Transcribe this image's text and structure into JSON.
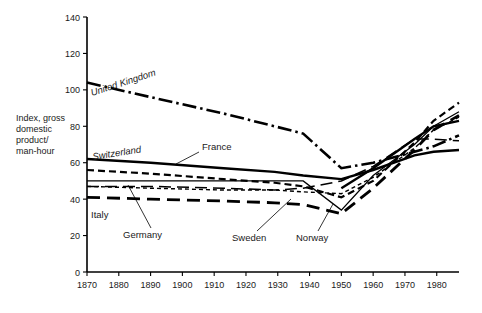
{
  "chart_data": {
    "type": "line",
    "title": "",
    "xlabel": "",
    "ylabel": "Index, gross domestic product/man-hour",
    "ylabel_lines": [
      "Index, gross",
      "domestic",
      "product/",
      "man-hour"
    ],
    "xlim": [
      1870,
      1987
    ],
    "ylim": [
      0,
      140
    ],
    "grid": false,
    "legend_position": "inline-labels",
    "y_ticks": [
      0,
      20,
      40,
      60,
      80,
      100,
      120,
      140
    ],
    "y_tick_labels": [
      "0",
      "20",
      "40",
      "60",
      "80",
      "100",
      "120",
      "140"
    ],
    "x_ticks": [
      1870,
      1880,
      1890,
      1900,
      1910,
      1920,
      1930,
      1940,
      1950,
      1960,
      1970,
      1980
    ],
    "x_tick_labels": [
      "1870",
      "1880",
      "1890",
      "1900",
      "1910",
      "1920",
      "1930",
      "1940",
      "1950",
      "1960",
      "1970",
      "1980"
    ],
    "series": [
      {
        "name": "United Kingdom",
        "label": "United Kingdom",
        "style": "dash-dot",
        "width": 2.6,
        "color": "#000000",
        "x": [
          1870,
          1890,
          1913,
          1929,
          1938,
          1950,
          1960,
          1973,
          1979,
          1987
        ],
        "values": [
          104,
          96,
          87,
          80,
          76,
          57,
          60,
          66,
          69,
          75
        ]
      },
      {
        "name": "Switzerland",
        "label": "Switzerland",
        "style": "solid",
        "width": 2.4,
        "color": "#000000",
        "x": [
          1870,
          1890,
          1913,
          1929,
          1938,
          1950,
          1960,
          1973,
          1979,
          1987
        ],
        "values": [
          62,
          60,
          57,
          55,
          53,
          51,
          56,
          64,
          66,
          67
        ]
      },
      {
        "name": "France",
        "label": "France",
        "style": "dashed",
        "width": 2.2,
        "color": "#000000",
        "x": [
          1870,
          1890,
          1913,
          1929,
          1938,
          1950,
          1960,
          1973,
          1979,
          1987
        ],
        "values": [
          56,
          54,
          51,
          49,
          47,
          41,
          50,
          71,
          83,
          93
        ]
      },
      {
        "name": "Germany",
        "label": "Germany",
        "style": "solid-thin",
        "width": 1.3,
        "color": "#000000",
        "x": [
          1870,
          1890,
          1913,
          1929,
          1938,
          1950,
          1960,
          1973,
          1979,
          1987
        ],
        "values": [
          50,
          50,
          50,
          50,
          50,
          34,
          53,
          70,
          80,
          88
        ]
      },
      {
        "name": "Sweden",
        "label": "Sweden",
        "style": "long-dash",
        "width": 1.5,
        "color": "#000000",
        "x": [
          1870,
          1890,
          1913,
          1929,
          1938,
          1950,
          1960,
          1973,
          1979,
          1987
        ],
        "values": [
          47,
          47,
          46,
          45,
          46,
          50,
          58,
          73,
          73,
          72
        ]
      },
      {
        "name": "Norway",
        "label": "Norway",
        "style": "fine-dash",
        "width": 1.4,
        "color": "#000000",
        "x": [
          1870,
          1890,
          1913,
          1929,
          1938,
          1950,
          1960,
          1973,
          1979,
          1987
        ],
        "values": [
          47,
          46,
          45,
          45,
          44,
          43,
          52,
          68,
          78,
          85
        ]
      },
      {
        "name": "Italy",
        "label": "Italy",
        "style": "heavy-dash",
        "width": 2.8,
        "color": "#000000",
        "x": [
          1870,
          1890,
          1913,
          1929,
          1938,
          1950,
          1960,
          1973,
          1979,
          1987
        ],
        "values": [
          41,
          40,
          39,
          38,
          37,
          32,
          46,
          67,
          78,
          86
        ]
      },
      {
        "name": "Netherlands",
        "label": "",
        "style": "solid",
        "width": 2.4,
        "color": "#000000",
        "x": [
          1950,
          1960,
          1973,
          1979,
          1987
        ],
        "values": [
          46,
          57,
          73,
          80,
          83
        ]
      }
    ],
    "annotations": [
      {
        "text": "United Kingdom",
        "kind": "rotated-inline"
      },
      {
        "text": "Switzerland",
        "kind": "inline"
      },
      {
        "text": "France",
        "kind": "leader"
      },
      {
        "text": "Germany",
        "kind": "leader"
      },
      {
        "text": "Italy",
        "kind": "inline"
      },
      {
        "text": "Sweden",
        "kind": "leader"
      },
      {
        "text": "Norway",
        "kind": "leader"
      }
    ]
  }
}
